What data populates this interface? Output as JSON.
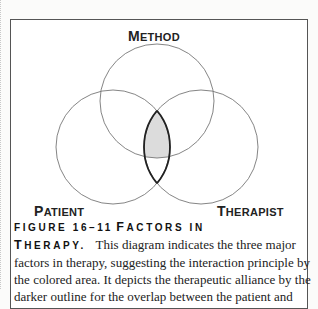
{
  "diagram": {
    "circles": [
      {
        "label": "Method",
        "cx": 157,
        "cy": 101,
        "r": 57
      },
      {
        "label": "Patient",
        "cx": 113,
        "cy": 147,
        "r": 57
      },
      {
        "label": "Therapist",
        "cx": 201,
        "cy": 147,
        "r": 57
      }
    ],
    "labels": {
      "method_first": "M",
      "method_rest": "ETHOD",
      "patient_first": "P",
      "patient_rest": "ATIENT",
      "therapist_first": "T",
      "therapist_rest": "HERAPIST"
    },
    "shaded_region": "patient ∩ therapist ∩ method",
    "shade_color": "#dcdcdc",
    "outline_region": "patient ∩ therapist"
  },
  "caption": {
    "figure_number": "FIGURE 16–11",
    "title_first_F": "F",
    "title_rest_1": "ACTORS IN",
    "title_first_T": "T",
    "title_rest_2": "HERAPY.",
    "text_line1": "This diagram indicates the three major",
    "text_line2": "factors in therapy, suggesting the interaction principle by",
    "text_line3": "the colored area. It depicts the therapeutic alliance by the",
    "text_line4": "darker outline for the overlap between the patient and"
  }
}
